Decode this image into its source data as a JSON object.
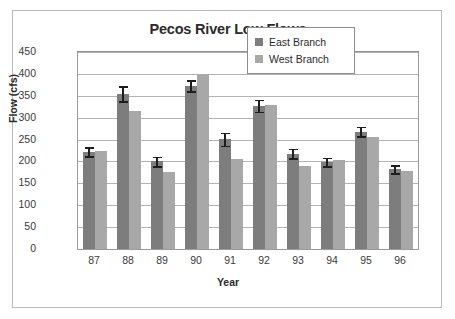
{
  "chart_data": {
    "type": "bar",
    "title": "Pecos River Low Flows",
    "xlabel": "Year",
    "ylabel": "Flow (cfs)",
    "categories": [
      "87",
      "88",
      "89",
      "90",
      "91",
      "92",
      "93",
      "94",
      "95",
      "96"
    ],
    "ylim": [
      0,
      450
    ],
    "yticks": [
      0,
      50,
      100,
      150,
      200,
      250,
      300,
      350,
      400,
      450
    ],
    "grid": true,
    "legend_position": "top-right",
    "series": [
      {
        "name": "East Branch",
        "color": "#7d7d7d",
        "values": [
          222,
          355,
          200,
          373,
          251,
          327,
          218,
          199,
          268,
          182
        ],
        "errors": [
          10,
          17,
          11,
          13,
          15,
          14,
          11,
          10,
          11,
          9
        ]
      },
      {
        "name": "West Branch",
        "color": "#a8a8a8",
        "values": [
          224,
          315,
          176,
          400,
          205,
          329,
          190,
          203,
          257,
          179
        ],
        "errors": [
          0,
          0,
          0,
          0,
          0,
          0,
          0,
          0,
          0,
          0
        ]
      }
    ]
  }
}
